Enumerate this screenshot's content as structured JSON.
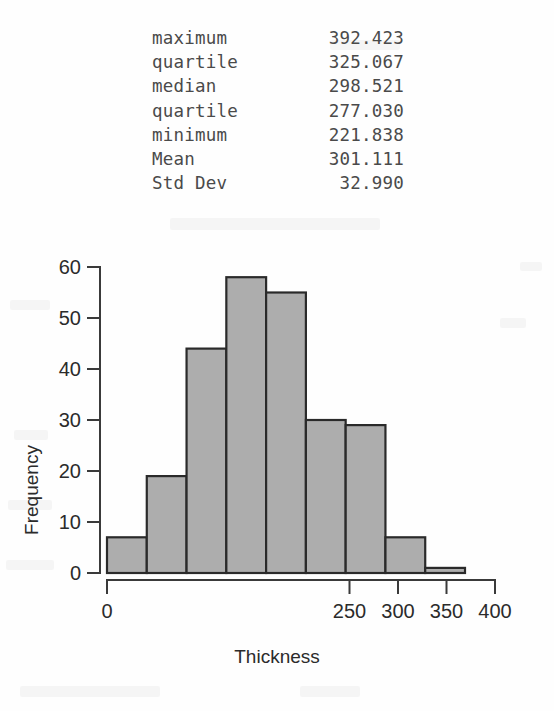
{
  "statistics": {
    "rows": [
      {
        "label": "maximum",
        "value": "392.423"
      },
      {
        "label": "quartile",
        "value": "325.067"
      },
      {
        "label": "median",
        "value": "298.521"
      },
      {
        "label": "quartile",
        "value": "277.030"
      },
      {
        "label": "minimum",
        "value": "221.838"
      },
      {
        "label": "Mean",
        "value": "301.111"
      },
      {
        "label": "Std Dev",
        "value": "32.990"
      }
    ]
  },
  "chart_data": {
    "type": "bar",
    "title": "",
    "subtitle": "",
    "xlabel": "Thickness",
    "ylabel": "Frequency",
    "xlim": [
      0,
      400
    ],
    "ylim": [
      0,
      60
    ],
    "grid": false,
    "legend": null,
    "xticks": [
      "0",
      "250",
      "300",
      "350",
      "400"
    ],
    "xtick_values": [
      0,
      250,
      300,
      350,
      400
    ],
    "yticks": [
      "0",
      "10",
      "20",
      "30",
      "40",
      "50",
      "60"
    ],
    "ytick_values": [
      0,
      10,
      20,
      30,
      40,
      50,
      60
    ],
    "bin_edges": [
      200,
      225,
      250,
      275,
      300,
      325,
      350,
      375,
      400,
      425
    ],
    "categories": [
      "200-225",
      "225-250",
      "250-275",
      "275-300",
      "300-325",
      "325-350",
      "350-375",
      "375-400",
      "400-425"
    ],
    "values": [
      7,
      19,
      44,
      58,
      55,
      30,
      29,
      7,
      1
    ],
    "bar_fill": "#adadad",
    "bar_stroke": "#2a2a2a"
  },
  "colors": {
    "background": "#fefefe",
    "text": "#2b2b2b",
    "stats_text": "#4a4a4a",
    "axis": "#3a3a3a"
  }
}
